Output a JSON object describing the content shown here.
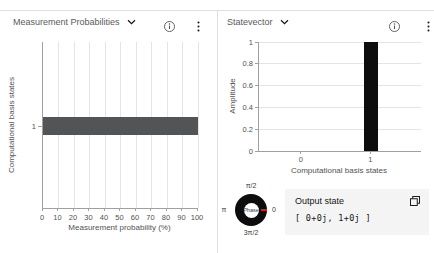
{
  "left_panel": {
    "title": "Measurement Probabilities"
  },
  "right_panel": {
    "title": "Statevector",
    "phase_wheel": {
      "center_label": "Phase",
      "tick_top": "π/2",
      "tick_right": "0",
      "tick_bottom": "3π/2",
      "tick_left": "π"
    },
    "output_state": {
      "title": "Output state",
      "value": "[ 0+0j, 1+0j ]"
    }
  },
  "icons": {
    "dropdown": "chevron-down",
    "info": "information",
    "menu": "overflow-menu-vertical",
    "copy": "copy"
  },
  "colors": {
    "prob_bar": "#535456",
    "amp_bar": "#0d0d0d",
    "grid": "#e4e4e4",
    "axis": "#a0a0a0",
    "text": "#525252",
    "card_bg": "#f4f4f4",
    "phase_indicator": "#e0191c"
  },
  "chart_data": [
    {
      "type": "bar",
      "orientation": "horizontal",
      "title": "Measurement Probabilities",
      "categories": [
        "1"
      ],
      "values": [
        100
      ],
      "xlabel": "Measurement probability (%)",
      "ylabel": "Computational basis states",
      "x_ticks": [
        "0",
        "10",
        "20",
        "30",
        "40",
        "50",
        "60",
        "70",
        "80",
        "90",
        "100"
      ],
      "xlim": [
        0,
        100
      ],
      "grid": "vertical",
      "legend": "none"
    },
    {
      "type": "bar",
      "orientation": "vertical",
      "title": "Statevector",
      "categories": [
        "0",
        "1"
      ],
      "values": [
        0,
        1
      ],
      "xlabel": "Computational basis states",
      "ylabel": "Amplitude",
      "y_ticks": [
        "0",
        "0.2",
        "0.4",
        "0.6",
        "0.8",
        "1"
      ],
      "ylim": [
        0,
        1
      ],
      "grid": "horizontal",
      "legend": "none"
    }
  ]
}
